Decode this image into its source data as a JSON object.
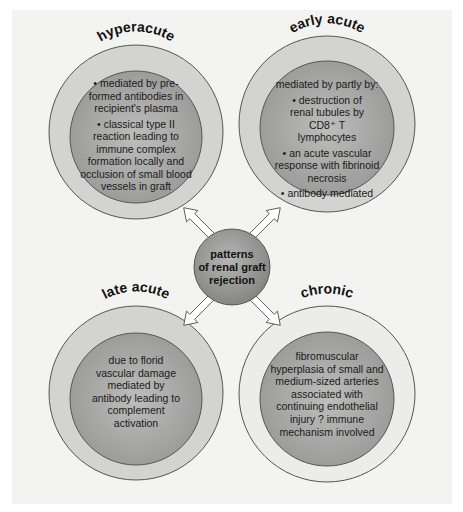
{
  "center": {
    "lines": [
      "patterns",
      "of renal graft",
      "rejection"
    ]
  },
  "nodes": {
    "hyperacute": {
      "title": "hyperacute",
      "items": [
        "• mediated by pre-formed antibodies in recipient's plasma",
        "• classical type II reaction leading to immune complex formation locally and occlusion of small blood vessels in graft"
      ]
    },
    "early_acute": {
      "title": "early acute",
      "intro": "mediated by partly by:",
      "items": [
        "• destruction of renal tubules by CD8⁺ T lymphocytes",
        "• an acute vascular response with fibrinoid necrosis",
        "• antibody mediated"
      ]
    },
    "late_acute": {
      "title": "late acute",
      "text": "due to florid vascular damage mediated by antibody leading to complement activation"
    },
    "chronic": {
      "title": "chronic",
      "text": "fibromuscular hyperplasia of small and medium-sized arteries associated with continuing endothelial injury ? immune mechanism involved"
    }
  },
  "colors": {
    "outer_ring": "#cfcfcd",
    "inner_disk": "#a9a9a7",
    "center_disk": "#9a9a98",
    "background": "#f3f3f1",
    "arrow_fill": "#ffffff",
    "stroke": "#555555"
  }
}
